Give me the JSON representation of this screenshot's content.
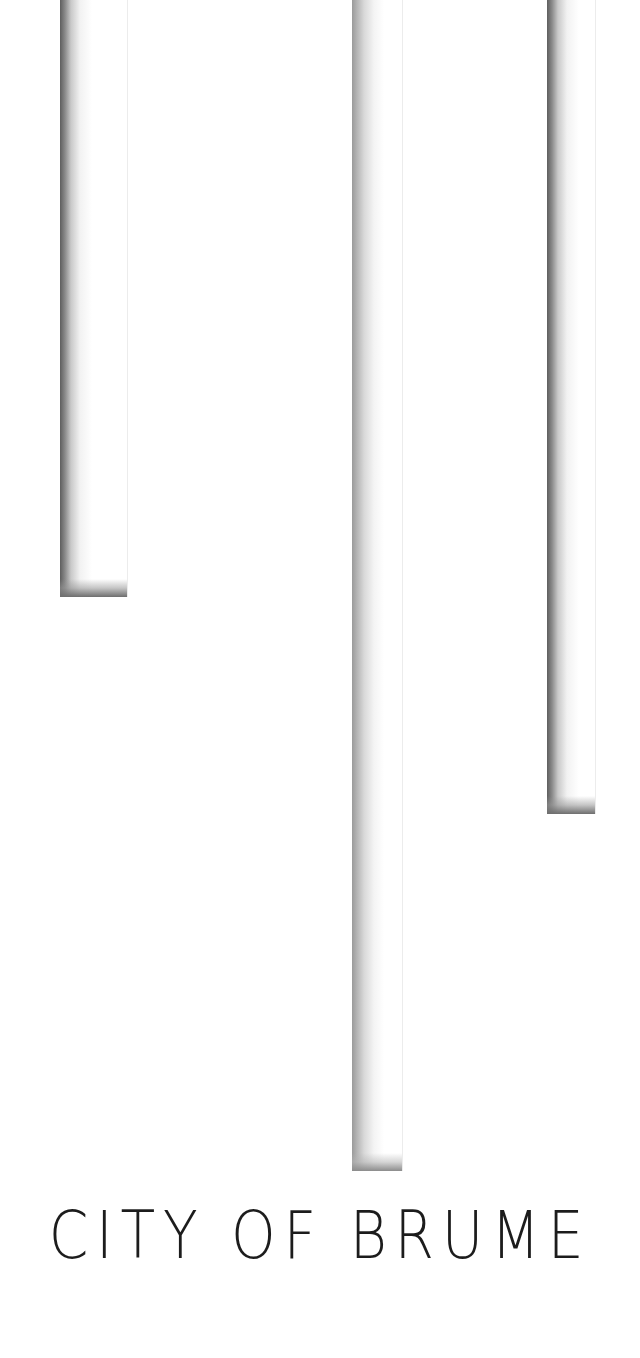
{
  "poster": {
    "title": "CITY OF BRUME",
    "background_color": "#ffffff",
    "text_color": "#1c1c1c",
    "bars": [
      {
        "name": "left-bar",
        "x": 60,
        "width": 68,
        "height": 597
      },
      {
        "name": "middle-bar",
        "x": 352,
        "width": 51,
        "height": 1171
      },
      {
        "name": "right-bar",
        "x": 547,
        "width": 49,
        "height": 814
      }
    ]
  }
}
